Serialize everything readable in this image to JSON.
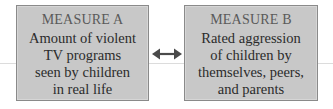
{
  "diagram": {
    "measure_a": {
      "title": "MEASURE A",
      "lines": [
        "Amount of violent",
        "TV programs",
        "seen by children",
        "in real life"
      ]
    },
    "measure_b": {
      "title": "MEASURE B",
      "lines": [
        "Rated aggression",
        "of children by",
        "themselves, peers,",
        "and parents"
      ]
    },
    "connector": {
      "icon": "double-headed-arrow-icon",
      "meaning": "bidirectional"
    },
    "colors": {
      "box_fill": "#c8c8c8",
      "box_border": "#8a8a8a",
      "arrow": "#4a4a4a"
    }
  }
}
